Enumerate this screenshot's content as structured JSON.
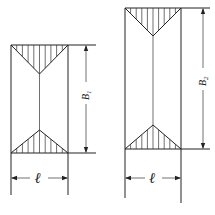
{
  "figures": [
    {
      "id": "fig-1",
      "height_label": {
        "base": "B",
        "sub": "1"
      },
      "width_label": "ℓ"
    },
    {
      "id": "fig-2",
      "height_label": {
        "base": "B",
        "sub": "2"
      },
      "width_label": "ℓ"
    }
  ],
  "colors": {
    "line": "#222222",
    "background": "#ffffff"
  }
}
